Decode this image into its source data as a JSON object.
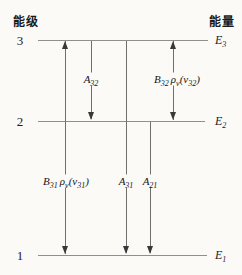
{
  "header": {
    "left": "能级",
    "right": "能量"
  },
  "levels": [
    {
      "number": "3",
      "energy_base": "E",
      "energy_sub": "3"
    },
    {
      "number": "2",
      "energy_base": "E",
      "energy_sub": "2"
    },
    {
      "number": "1",
      "energy_base": "E",
      "energy_sub": "1"
    }
  ],
  "transitions": {
    "A32": {
      "base": "A",
      "base_sub": "32"
    },
    "B32": {
      "base": "B",
      "base_sub": "32",
      "rho": "ρ",
      "rho_sub": "ν",
      "arg": "(ν",
      "arg_sub": "32",
      "close": ")"
    },
    "B31": {
      "base": "B",
      "base_sub": "31",
      "rho": "ρ",
      "rho_sub": "ν",
      "arg": "(ν",
      "arg_sub": "31",
      "close": ")"
    },
    "A31": {
      "base": "A",
      "base_sub": "31"
    },
    "A21": {
      "base": "A",
      "base_sub": "21"
    }
  },
  "colors": {
    "background": "#fbfaf7",
    "level_line": "#8f8f8f",
    "arrow_line": "#6f6f6f",
    "arrowhead": "#383838",
    "text": "#1a1a1a"
  }
}
